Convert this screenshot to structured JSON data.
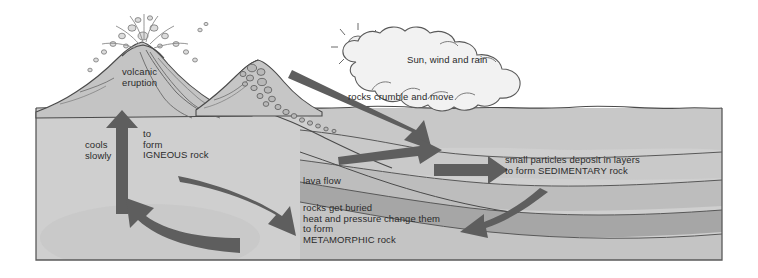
{
  "diagram": {
    "type": "process-diagram",
    "frame": {
      "stroke": "#5a5a5a"
    },
    "palette": {
      "ground_light": "#cfcfcf",
      "ground_mid": "#c2c2c2",
      "ground_dark": "#b0b0b0",
      "sediment_band": "#a8a8a8",
      "arrow_dark": "#5e5e5e",
      "arrow_mid": "#6e6e6e",
      "outline": "#4a4a4a",
      "cloud_fill": "#f2f2f2",
      "text": "#2b2b2b",
      "rock_fill": "#b8b8b8"
    },
    "labels": {
      "volcanic_eruption": "volcanic\neruption",
      "cools_slowly": "cools\nslowly",
      "to_form_igneous": "to\nform\nIGNEOUS rock",
      "lava_flow": "lava flow",
      "metamorphic": "rocks get buried\nheat and pressure change them\nto form\nMETAMORPHIC rock",
      "sun_wind_rain": "Sun, wind and rain",
      "rocks_crumble": "rocks crumble and move",
      "sedimentary": "small particles deposit in layers\nto form SEDIMENTARY rock"
    },
    "icons": {
      "sun": "sun-icon",
      "cloud": "cloud-icon",
      "volcano": "volcano-icon",
      "mountain": "mountain-icon",
      "falling_rocks": "falling-rocks-icon"
    },
    "arrows": [
      {
        "name": "arrow-up-igneous",
        "label_key": "to_form_igneous",
        "direction": "up"
      },
      {
        "name": "arrow-lava-flow",
        "label_key": "lava_flow",
        "direction": "down-right"
      },
      {
        "name": "arrow-rocks-crumble",
        "label_key": "rocks_crumble",
        "direction": "down-right"
      },
      {
        "name": "arrow-sedimentary",
        "label_key": "sedimentary",
        "direction": "right"
      },
      {
        "name": "arrow-metamorphic-return",
        "label_key": "metamorphic",
        "direction": "left"
      },
      {
        "name": "arrow-melt-return",
        "label_key": "cools_slowly",
        "direction": "up-left"
      },
      {
        "name": "arrow-into-basin",
        "label_key": "",
        "direction": "right"
      }
    ]
  }
}
